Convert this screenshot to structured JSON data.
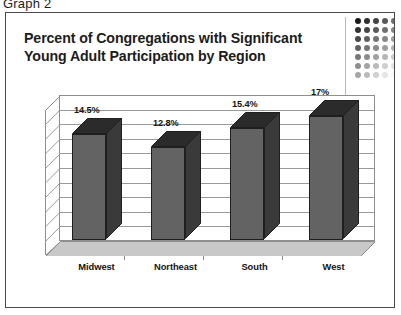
{
  "figure": {
    "caption": "Graph 2"
  },
  "chart_title": {
    "line1": "Percent of Congregations with Significant",
    "line2": "Young Adult Participation by Region"
  },
  "decoration": {
    "dot_grid_name": "dot-grid-decoration",
    "columns": 5,
    "rows": 7,
    "base_color": "#1a1a1a"
  },
  "chart_data": {
    "type": "bar",
    "title": "Percent of Congregations with Significant Young Adult Participation by Region",
    "categories": [
      "Midwest",
      "Northeast",
      "South",
      "West"
    ],
    "values": [
      14.5,
      12.8,
      15.4,
      17.0
    ],
    "value_labels": [
      "14.5%",
      "12.8%",
      "15.4%",
      "17%"
    ],
    "xlabel": "",
    "ylabel": "",
    "ylim": [
      0,
      20
    ],
    "gridlines": 9,
    "grid": true,
    "legend": "none",
    "style": "3d-column",
    "series": [
      {
        "name": "Percent of Congregations",
        "values": [
          14.5,
          12.8,
          15.4,
          17.0
        ]
      }
    ]
  },
  "colors": {
    "bar_front": "#636363",
    "bar_side": "#3a3a3a",
    "bar_top": "#2b2b2b",
    "bar_outline": "#1f1f1f",
    "gridline": "#9a9a9a",
    "frame_border": "#4a4a4a",
    "floor": "#c8c8c8",
    "text": "#141414"
  }
}
